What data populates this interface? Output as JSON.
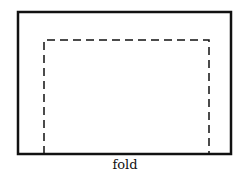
{
  "diagram": {
    "type": "fold-template",
    "outer_rect": {
      "style": "solid",
      "color": "#111111"
    },
    "inner_rect": {
      "style": "dashed",
      "color": "#111111",
      "open_side": "bottom"
    },
    "label": "fold"
  }
}
